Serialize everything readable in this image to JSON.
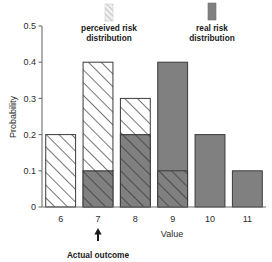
{
  "chart_data": {
    "type": "bar",
    "title": "",
    "xlabel": "Value",
    "ylabel": "Probability",
    "categories": [
      "6",
      "7",
      "8",
      "9",
      "10",
      "11"
    ],
    "xlim": [
      5.5,
      11.5
    ],
    "ylim": [
      0,
      0.5
    ],
    "ytick_labels": [
      "0",
      "0.1",
      "0.2",
      "0.3",
      "0.4",
      "0.5"
    ],
    "ytick_values": [
      0,
      0.1,
      0.2,
      0.3,
      0.4,
      0.5
    ],
    "grid": false,
    "legend_position": "top",
    "overlap_mode": "overlaid",
    "series": [
      {
        "name": "perceived risk distribution",
        "style": "hatched",
        "fill": "#ffffff",
        "hatch": "diagonal-up",
        "values": [
          0.2,
          0.4,
          0.3,
          0.1,
          0.0,
          0.0
        ]
      },
      {
        "name": "real risk distribution",
        "style": "solid",
        "fill": "#808080",
        "values": [
          0.0,
          0.1,
          0.2,
          0.4,
          0.2,
          0.1
        ]
      }
    ],
    "annotations": [
      {
        "name": "actual-outcome",
        "label": "Actual outcome",
        "marker": "up-arrow",
        "x_category": "7"
      }
    ]
  },
  "legend": {
    "items": [
      {
        "label_line1": "perceived risk",
        "label_line2": "distribution",
        "swatch": "hatched",
        "color": "#d9d9d9"
      },
      {
        "label_line1": "real risk",
        "label_line2": "distribution",
        "swatch": "solid",
        "color": "#808080"
      }
    ]
  },
  "colors": {
    "real_risk": "#808080",
    "perceived_risk": "#ffffff",
    "outline": "#3a3a3a",
    "axis": "#6e6e6e",
    "text": "#1a1a1a",
    "background": "#ffffff"
  }
}
